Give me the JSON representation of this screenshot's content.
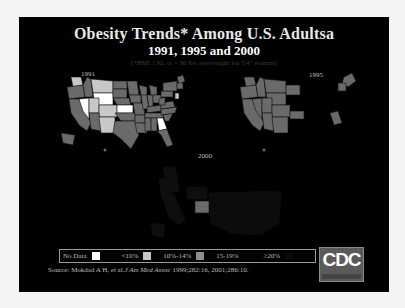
{
  "slide": {
    "title": "Obesity Trends* Among U.S. Adultsa",
    "subtitle": "1991, 1995 and 2000",
    "note": "(*BMI ≥30, or ~ 30 lbs overweight for 5'4\" woman)"
  },
  "maps": [
    {
      "year": "1991"
    },
    {
      "year": "1995"
    },
    {
      "year": "2000"
    }
  ],
  "legend": {
    "items": [
      {
        "label": "No Data",
        "color": "#ffffff"
      },
      {
        "label": "<10%",
        "color": "#c8c8c8"
      },
      {
        "label": "10%-14%",
        "color": "#8a8a8a"
      },
      {
        "label": "15-19%",
        "color": "#6a6a6a"
      },
      {
        "label": "≥20%",
        "color": "#0a0a0a"
      }
    ]
  },
  "source": {
    "prefix": "Source: Mokdad A H, et al.",
    "journal": "J Am Med Assoc",
    "suffix": " 1999;282:16, 2001;286:10."
  },
  "logo": {
    "text": "CDC"
  },
  "colors": {
    "slide_bg": "#000000",
    "no_data": "#ffffff",
    "lt10": "#c8c8c8",
    "10to14": "#8a8a8a",
    "15to19": "#6a6a6a",
    "ge20": "#0a0a0a"
  }
}
